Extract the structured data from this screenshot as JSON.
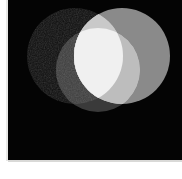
{
  "figure": {
    "background_color": "#040404",
    "page_background_color": "#ffffff",
    "panel": {
      "x": 8,
      "y": 0,
      "width": 174,
      "height": 161
    }
  },
  "chart_data": {
    "type": "venn",
    "xlabel": "",
    "ylabel": "",
    "legend": "none",
    "grid": false,
    "canvas": {
      "width": 174,
      "height": 161,
      "background": "#040404"
    },
    "sets": [
      {
        "name": "A",
        "label": "dark-left-disk",
        "cx": 67,
        "cy": 56,
        "r": 48,
        "fill": "#0d0d0d",
        "value": 0.05,
        "texture": "grainy-noise"
      },
      {
        "name": "B",
        "label": "mid-gray-right-disk",
        "cx": 114,
        "cy": 56,
        "r": 48,
        "fill": "#8a8a8a",
        "value": 0.54,
        "texture": "flat"
      },
      {
        "name": "C",
        "label": "light-bottom-disk",
        "cx": 90,
        "cy": 70,
        "r": 42,
        "fill": "#3a3a3a",
        "value": 0.23,
        "texture": "flat"
      }
    ],
    "regions": [
      {
        "id": "A",
        "label": "A only",
        "fill": "#0d0d0d",
        "value": 0.05
      },
      {
        "id": "B",
        "label": "B only",
        "fill": "#8a8a8a",
        "value": 0.54
      },
      {
        "id": "C",
        "label": "C only",
        "fill": "#3a3a3a",
        "value": 0.23
      },
      {
        "id": "AB",
        "label": "A and B",
        "fill": "#c9c9c9",
        "value": 0.79
      },
      {
        "id": "BC",
        "label": "B and C",
        "fill": "#bdbdbd",
        "value": 0.74
      },
      {
        "id": "AC",
        "label": "A and C",
        "fill": "#3e3e3e",
        "value": 0.24
      },
      {
        "id": "ABC",
        "label": "A and B and C",
        "fill": "#f0f0f0",
        "value": 0.94
      }
    ],
    "blend_mode": "additive-lighten",
    "value_range": [
      0,
      1
    ]
  }
}
